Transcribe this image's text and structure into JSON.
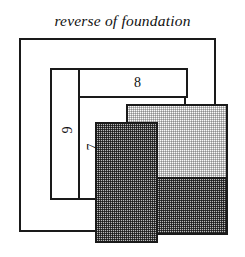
{
  "figure": {
    "title": "reverse of foundation",
    "background_color": "#ffffff",
    "stroke_color": "#1a1a1a",
    "shapes": [
      {
        "name": "outer-frame",
        "label": "",
        "fill": "white",
        "x": 19,
        "y": 38,
        "width": 197,
        "height": 194
      },
      {
        "name": "rect-9",
        "label": "9",
        "fill": "white",
        "x": 50,
        "y": 68,
        "width": 42,
        "height": 132
      },
      {
        "name": "rect-8",
        "label": "8",
        "fill": "white",
        "x": 78,
        "y": 68,
        "width": 110,
        "height": 30
      },
      {
        "name": "rect-7",
        "label": "7",
        "fill": "white",
        "x": 78,
        "y": 96,
        "width": 108,
        "height": 104
      },
      {
        "name": "rect-light",
        "label": "",
        "fill": "light-stipple",
        "x": 126,
        "y": 104,
        "width": 102,
        "height": 131,
        "split_y": 71
      },
      {
        "name": "rect-dark",
        "label": "",
        "fill": "dark-stipple",
        "x": 95,
        "y": 122,
        "width": 63,
        "height": 121
      }
    ],
    "labels": [
      {
        "name": "label-8",
        "text": "8",
        "x": 134,
        "y": 76,
        "rotated": false
      },
      {
        "name": "label-9",
        "text": "9",
        "x": 64,
        "y": 123,
        "rotated": true
      },
      {
        "name": "label-7",
        "text": "7",
        "x": 89,
        "y": 140,
        "rotated": true
      }
    ],
    "colors": {
      "stroke": "#1a1a1a",
      "light_fill": "#fbfbfb",
      "dark_fill": "#b8b8b8",
      "text": "#111111"
    }
  }
}
